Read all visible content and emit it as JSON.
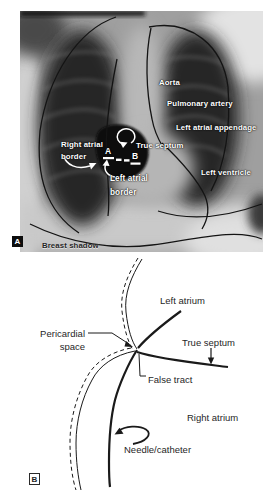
{
  "panelA": {
    "tag": "A",
    "labels": {
      "aorta": "Aorta",
      "pulmonary_artery": "Pulmonary artery",
      "left_atrial_appendage": "Left atrial appendage",
      "right_atrial_border_1": "Right atrial",
      "right_atrial_border_2": "border",
      "true_septum": "True septum",
      "marker_a": "A",
      "marker_b": "B",
      "left_atrial_border_1": "Left atrial",
      "left_atrial_border_2": "border",
      "left_ventricle": "Left ventricle",
      "breast_shadow": "Breast shadow"
    }
  },
  "panelB": {
    "tag": "B",
    "labels": {
      "left_atrium": "Left atrium",
      "pericardial_space_1": "Pericardial",
      "pericardial_space_2": "space",
      "true_septum": "True septum",
      "false_tract": "False tract",
      "right_atrium": "Right atrium",
      "needle_catheter": "Needle/catheter"
    }
  },
  "colors": {
    "diagram_ink": "#1a1a1a",
    "xray_label": "#ffffff",
    "page_background": "#ffffff"
  }
}
